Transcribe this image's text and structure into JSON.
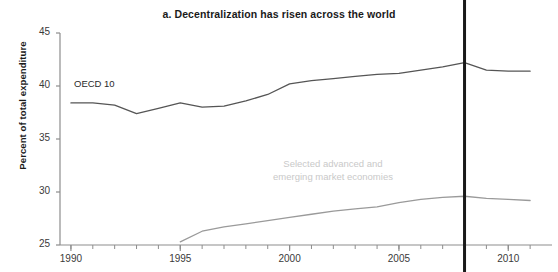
{
  "chart_data": {
    "type": "line",
    "title": "a. Decentralization has risen across the world",
    "xlabel": "",
    "ylabel": "Percent of total expenditure",
    "xlim": [
      1989.5,
      2012.0
    ],
    "ylim": [
      25,
      45
    ],
    "yticks": [
      25,
      30,
      35,
      40,
      45
    ],
    "ytick_labels": [
      "25",
      "30",
      "35",
      "40",
      "45"
    ],
    "xticks": [
      1990,
      1995,
      2000,
      2005,
      2010
    ],
    "xtick_labels": [
      "1990",
      "1995",
      "2000",
      "2005",
      "2010"
    ],
    "minor_xtick_interval": 1,
    "grid": false,
    "legend_position": "inline-annotation",
    "annotations": [
      {
        "text": "OECD 10",
        "series": "OECD 10",
        "x": 1990.6,
        "y": 40.5
      },
      {
        "text": "Selected advanced and emerging market economies",
        "series": "Selected advanced and emerging market economies",
        "x": 2002.3,
        "y": 33.0
      }
    ],
    "reference_line": {
      "x": 2008,
      "orientation": "vertical",
      "color": "#1a1a1a",
      "width_px": 3
    },
    "series": [
      {
        "name": "OECD 10",
        "color": "#555555",
        "x": [
          1990,
          1991,
          1992,
          1993,
          1994,
          1995,
          1996,
          1997,
          1998,
          1999,
          2000,
          2001,
          2002,
          2003,
          2004,
          2005,
          2006,
          2007,
          2008,
          2009,
          2010,
          2011
        ],
        "values": [
          38.4,
          38.4,
          38.2,
          37.4,
          37.9,
          38.4,
          38.0,
          38.1,
          38.6,
          39.2,
          40.2,
          40.5,
          40.7,
          40.9,
          41.1,
          41.2,
          41.5,
          41.8,
          42.2,
          41.5,
          41.4,
          41.4
        ]
      },
      {
        "name": "Selected advanced and emerging market economies",
        "color": "#9a9a9a",
        "x": [
          1995,
          1996,
          1997,
          1998,
          1999,
          2000,
          2001,
          2002,
          2003,
          2004,
          2005,
          2006,
          2007,
          2008,
          2009,
          2010,
          2011
        ],
        "values": [
          25.3,
          26.3,
          26.7,
          27.0,
          27.3,
          27.6,
          27.9,
          28.2,
          28.4,
          28.6,
          29.0,
          29.3,
          29.5,
          29.6,
          29.4,
          29.3,
          29.2
        ]
      }
    ]
  },
  "labels": {
    "oecd_annotation": "OECD 10",
    "emerging_annotation_line1": "Selected advanced and",
    "emerging_annotation_line2": "emerging market economies"
  }
}
